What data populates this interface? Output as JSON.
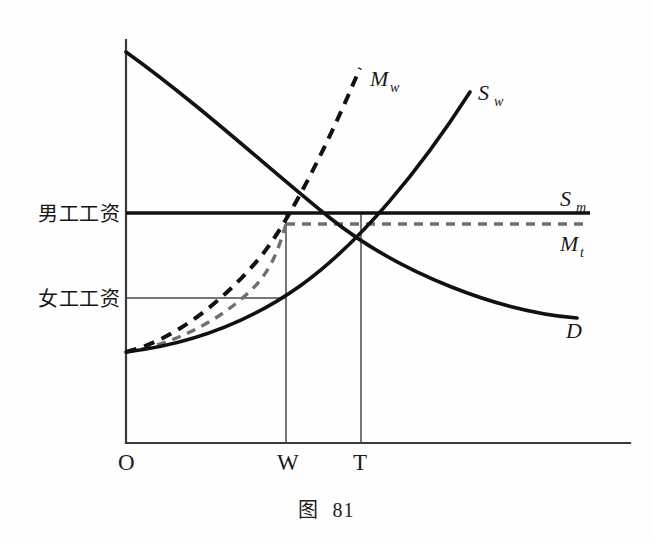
{
  "figure": {
    "caption_prefix": "图",
    "caption_number": "81",
    "background_color": "#fefefe",
    "ink_color": "#111111",
    "grey_ink_color": "#6f6f6f"
  },
  "axes": {
    "origin_label": "O",
    "x_ticks": [
      {
        "label": "W",
        "x_px": 286
      },
      {
        "label": "T",
        "x_px": 361
      }
    ],
    "y_value_labels": [
      {
        "label": "男工工资",
        "meaning": "male-worker-wage",
        "y_px": 213
      },
      {
        "label": "女工工资",
        "meaning": "female-worker-wage",
        "y_px": 298
      }
    ],
    "x_axis": {
      "x1": 126,
      "y1": 443,
      "x2": 630,
      "y2": 443
    },
    "y_axis": {
      "x1": 126,
      "y1": 40,
      "x2": 126,
      "y2": 443
    }
  },
  "curves": [
    {
      "id": "D",
      "label": "D",
      "label_x": 566,
      "label_y": 338,
      "style": "solid",
      "weight": "thick",
      "color": "#111111",
      "description": "downward-sloping demand curve",
      "path": "M 126,52 C 200,105 270,170 330,218 C 400,274 500,312 577,318"
    },
    {
      "id": "Sw",
      "label": "S",
      "subscript": "w",
      "label_x": 478,
      "label_y": 100,
      "style": "solid",
      "weight": "thick",
      "color": "#111111",
      "description": "upward-sloping female labour supply curve",
      "path": "M 126,352 C 185,345 245,325 300,286 C 360,243 420,170 470,92"
    },
    {
      "id": "Sm",
      "label": "S",
      "subscript": "m",
      "label_x": 560,
      "label_y": 206,
      "style": "solid",
      "weight": "thick",
      "color": "#111111",
      "description": "horizontal male wage line",
      "path": "M 126,213 L 590,213"
    },
    {
      "id": "Mw",
      "label": "M",
      "subscript": "w",
      "label_x": 370,
      "label_y": 86,
      "style": "dashed",
      "weight": "thick",
      "color": "#111111",
      "description": "steep dashed marginal cost of female labour",
      "path": "M 126,352 C 175,340 225,300 262,255 C 290,220 330,140 360,68"
    },
    {
      "id": "Mt",
      "label": "M",
      "subscript": "t",
      "label_x": 560,
      "label_y": 251,
      "style": "dashed",
      "weight": "medium",
      "color": "#6f6f6f",
      "description": "grey dashed curve rising to W then horizontal",
      "path": "M 126,352 C 178,344 228,316 258,283 C 274,264 280,244 286,224"
    },
    {
      "id": "Mt-horizontal",
      "label": "",
      "style": "dashed",
      "weight": "medium",
      "color": "#6f6f6f",
      "description": "horizontal dashed extension of Mt after W",
      "path": "M 286,224 L 590,224"
    }
  ],
  "guide_lines": [
    {
      "id": "w-vertical",
      "description": "vertical drop line at W",
      "path": "M 286,213 L 286,443"
    },
    {
      "id": "t-vertical",
      "description": "vertical drop line at T",
      "path": "M 361,213 L 361,443"
    },
    {
      "id": "female-wage-horizontal",
      "description": "horizontal line at female wage level up to W",
      "path": "M 126,298 L 286,298"
    }
  ]
}
